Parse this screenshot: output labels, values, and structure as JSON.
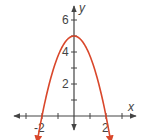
{
  "chart_data": {
    "type": "line",
    "title": "",
    "xlabel": "x",
    "ylabel": "y",
    "xlim": [
      -2.5,
      2.5
    ],
    "ylim": [
      -1.5,
      6.7
    ],
    "grid": false,
    "x_ticks": [
      -2,
      -1,
      1,
      2
    ],
    "y_ticks": [
      1,
      2,
      3,
      4,
      5,
      6
    ],
    "x_tick_labels": [
      "-2",
      "2"
    ],
    "y_tick_labels": [
      "2",
      "4",
      "6"
    ],
    "series": [
      {
        "name": "parabola",
        "equation": "y = 5 - 1.25x^2",
        "vertex": [
          0,
          5
        ],
        "x_intercepts": [
          -2,
          2
        ],
        "x": [
          -2.3,
          -2,
          -1.5,
          -1,
          -0.5,
          0,
          0.5,
          1,
          1.5,
          2,
          2.3
        ],
        "values": [
          -1.6,
          0,
          2.19,
          3.75,
          4.69,
          5,
          4.69,
          3.75,
          2.19,
          0,
          -1.6
        ],
        "color": "#d9472b",
        "arrows_at_ends": true
      }
    ]
  },
  "axes": {
    "x_label": "x",
    "y_label": "y",
    "x_tick_labels": {
      "neg2": "-2",
      "pos2": "2"
    },
    "y_tick_labels": {
      "two": "2",
      "four": "4",
      "six": "6"
    }
  },
  "colors": {
    "axis": "#444444",
    "curve": "#d9472b"
  }
}
